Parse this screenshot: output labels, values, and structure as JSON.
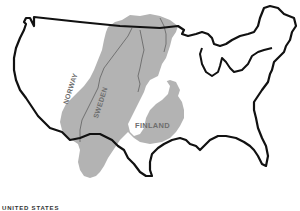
{
  "map": {
    "title": "Scandinavia overlaid on the United States",
    "labels": {
      "norway": "NORWAY",
      "sweden": "SWEDEN",
      "finland": "FINLAND",
      "united_states": "UNITED STATES"
    },
    "colors": {
      "scandinavia_fill": "#b3b3b3",
      "us_outline": "#111111",
      "border_lines": "#6a6a6a",
      "background": "#ffffff"
    }
  }
}
